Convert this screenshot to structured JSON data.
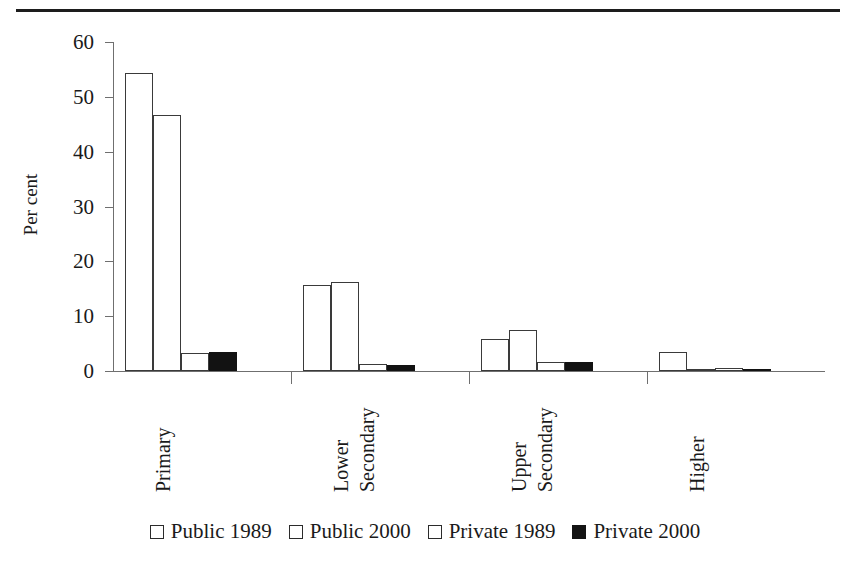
{
  "figure": {
    "top_rule": "horizontal-rule"
  },
  "chart_data": {
    "type": "bar",
    "title": "",
    "xlabel": "",
    "ylabel": "Per cent",
    "ylim": [
      0,
      60
    ],
    "yticks": [
      0,
      10,
      20,
      30,
      40,
      50,
      60
    ],
    "ytick_labels": [
      "0",
      "10",
      "20",
      "30",
      "40",
      "50",
      "60"
    ],
    "grid": false,
    "legend_position": "bottom",
    "categories": [
      "Primary",
      "Lower Secondary",
      "Upper Secondary",
      "Higher"
    ],
    "category_lines": [
      [
        "Primary"
      ],
      [
        "Lower",
        "Secondary"
      ],
      [
        "Upper",
        "Secondary"
      ],
      [
        "Higher"
      ]
    ],
    "series": [
      {
        "name": "Public 1989",
        "fill": "open",
        "values": [
          54.3,
          15.6,
          5.8,
          3.4
        ]
      },
      {
        "name": "Public 2000",
        "fill": "open",
        "values": [
          46.6,
          16.3,
          7.5,
          0.2
        ]
      },
      {
        "name": "Private 1989",
        "fill": "open",
        "values": [
          3.2,
          1.2,
          1.6,
          0.5
        ]
      },
      {
        "name": "Private 2000",
        "fill": "filled",
        "values": [
          3.5,
          1.1,
          1.6,
          0.1
        ]
      }
    ]
  },
  "legend": {
    "items": [
      {
        "label": "Public 1989",
        "swatch": "open"
      },
      {
        "label": "Public 2000",
        "swatch": "open"
      },
      {
        "label": "Private 1989",
        "swatch": "open"
      },
      {
        "label": "Private 2000",
        "swatch": "filled"
      }
    ]
  },
  "colors": {
    "open_fill": "#ffffff",
    "filled_fill": "#121212",
    "stroke": "#3a3a3a",
    "axis": "#6f6f6f",
    "text": "#1a1a1a"
  }
}
